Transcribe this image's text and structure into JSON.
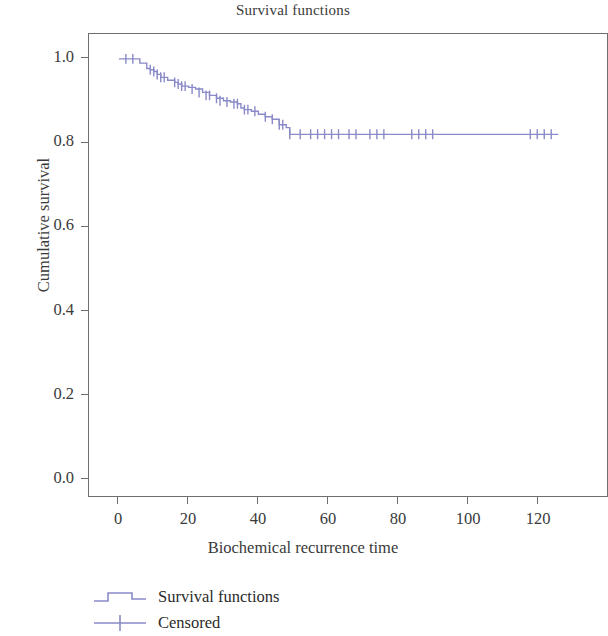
{
  "chart_data": {
    "type": "line",
    "title": "Survival functions",
    "xlabel": "Biochemical recurrence time",
    "ylabel": "Cumulative survival",
    "xlim": [
      -2,
      128
    ],
    "ylim": [
      0.0,
      1.04
    ],
    "xticks": [
      0,
      20,
      40,
      60,
      80,
      100,
      120
    ],
    "xtick_labels": [
      "0",
      "20",
      "40",
      "60",
      "80",
      "100",
      "120"
    ],
    "yticks": [
      0.0,
      0.2,
      0.4,
      0.6,
      0.8,
      1.0
    ],
    "ytick_labels": [
      "0.0",
      "0.2",
      "0.4",
      "0.6",
      "0.8",
      "1.0"
    ],
    "grid": false,
    "legend_position": "below-left",
    "series": [
      {
        "name": "Survival functions",
        "style": "step-post",
        "color": "#8a8ac8",
        "x": [
          0,
          2,
          6,
          8,
          9,
          10,
          11,
          12,
          14,
          16,
          17,
          18,
          20,
          22,
          24,
          26,
          28,
          30,
          32,
          34,
          35,
          36,
          38,
          40,
          42,
          44,
          46,
          48,
          49,
          126
        ],
        "y": [
          1.0,
          1.0,
          0.99,
          0.977,
          0.974,
          0.97,
          0.963,
          0.956,
          0.949,
          0.944,
          0.94,
          0.935,
          0.932,
          0.928,
          0.92,
          0.913,
          0.906,
          0.9,
          0.897,
          0.893,
          0.883,
          0.879,
          0.875,
          0.868,
          0.862,
          0.856,
          0.843,
          0.836,
          0.82,
          0.82
        ]
      }
    ],
    "censored": {
      "name": "Censored",
      "marker": "plus",
      "color": "#8a8ac8",
      "x": [
        2,
        4,
        9,
        10,
        11,
        12,
        13,
        16,
        17,
        18,
        19,
        21,
        23,
        25,
        26,
        28,
        29,
        31,
        33,
        34,
        36,
        37,
        39,
        42,
        44,
        46,
        47,
        49,
        52,
        55,
        57,
        59,
        61,
        63,
        66,
        68,
        72,
        74,
        76,
        84,
        86,
        88,
        90,
        118,
        120,
        122,
        124
      ],
      "y": [
        1.0,
        1.0,
        0.974,
        0.97,
        0.963,
        0.956,
        0.956,
        0.944,
        0.94,
        0.935,
        0.935,
        0.928,
        0.92,
        0.913,
        0.913,
        0.906,
        0.9,
        0.897,
        0.893,
        0.893,
        0.879,
        0.879,
        0.875,
        0.862,
        0.856,
        0.843,
        0.843,
        0.82,
        0.82,
        0.82,
        0.82,
        0.82,
        0.82,
        0.82,
        0.82,
        0.82,
        0.82,
        0.82,
        0.82,
        0.82,
        0.82,
        0.82,
        0.82,
        0.82,
        0.82,
        0.82,
        0.82
      ]
    },
    "plateau_value": 0.82,
    "plateau_start_x": 49,
    "series_color": "#8a8ac8",
    "frame_color": "#6e6e6e"
  },
  "legend": {
    "items": [
      {
        "label": "Survival functions",
        "icon": "step-line-icon"
      },
      {
        "label": "Censored",
        "icon": "plus-marker-icon"
      }
    ]
  }
}
